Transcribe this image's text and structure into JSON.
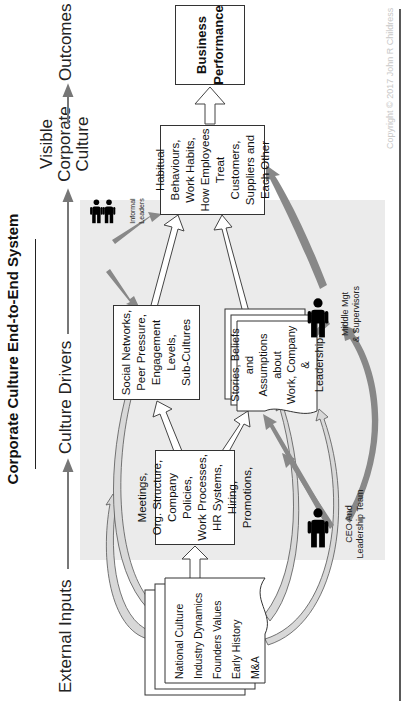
{
  "title": "Corporate Culture End-to-End System",
  "copyright": "Copyright © 2017 John R Childress",
  "stages": [
    {
      "label": "External Inputs"
    },
    {
      "label": "Culture Drivers"
    },
    {
      "label": "Visible Corporate Culture",
      "lines": [
        "Visible",
        "Corporate",
        "Culture"
      ]
    },
    {
      "label": "Outcomes"
    }
  ],
  "external_inputs": {
    "items": [
      "National Culture",
      "Industry Dynamics",
      "Founders Values",
      "Early History",
      "M&A"
    ]
  },
  "drivers": {
    "meetings": {
      "lines": [
        "Meetings,",
        "Org. Structure,",
        "Company Policies,",
        "Work Processes,",
        "HR Systems, Hiring,",
        "Promotions,"
      ]
    },
    "social": {
      "lines": [
        "Social Networks,",
        "Peer Pressure,",
        "Engagement",
        "Levels,",
        "Sub-Cultures"
      ]
    },
    "stories": {
      "lines": [
        "Stories, Beliefs and",
        "Assumptions about",
        "Work, Company &",
        "Leadership"
      ]
    }
  },
  "visible_culture": {
    "lines": [
      "Habitual",
      "Behaviours,",
      "Work Habits,",
      "How Employees",
      "Treat Customers,",
      "Suppliers and",
      "Each Other"
    ]
  },
  "outcomes": {
    "lines": [
      "Business",
      "Performance"
    ]
  },
  "actors": {
    "informal_leaders": {
      "lines": [
        "Informal",
        "Leaders"
      ]
    },
    "middle_mgt": {
      "lines": [
        "Middle Mgt",
        "& Supervisors"
      ]
    },
    "ceo": {
      "lines": [
        "CEO And",
        "Leadership Team"
      ]
    }
  },
  "colors": {
    "gray_area": "#ebebeb",
    "arrow_gray": "#888888",
    "outline": "#333333",
    "person": "#000000"
  }
}
